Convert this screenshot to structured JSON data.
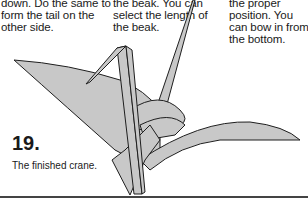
{
  "captions": {
    "left": "down. Do the same to form the tail on the other side.",
    "middle": "the beak. You can select the length of the beak.",
    "right": "the proper position. You can bow in from the bottom."
  },
  "step": {
    "number": "19.",
    "description": "The finished crane."
  },
  "colors": {
    "paper": "#c8c8c8",
    "outline": "#1e1e1e"
  }
}
